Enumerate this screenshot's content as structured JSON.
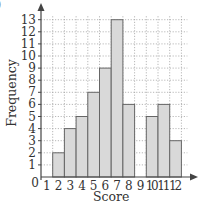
{
  "figure": {
    "clipped_label": ")"
  },
  "chart_data": {
    "type": "bar",
    "title": "",
    "xlabel": "Score",
    "ylabel": "Frequency",
    "categories": [
      "1",
      "2",
      "3",
      "4",
      "5",
      "6",
      "7",
      "8",
      "9",
      "10",
      "11",
      "12"
    ],
    "values": [
      0,
      2,
      4,
      5,
      7,
      9,
      13,
      6,
      0,
      5,
      6,
      3
    ],
    "xlim": [
      0,
      12
    ],
    "ylim": [
      0,
      13
    ],
    "yticks": [
      1,
      2,
      3,
      4,
      5,
      6,
      7,
      8,
      9,
      10,
      11,
      12,
      13
    ],
    "xticks": [
      1,
      2,
      3,
      4,
      5,
      6,
      7,
      8,
      9,
      10,
      11,
      12
    ],
    "origin_label": "0",
    "grid": true,
    "grid_style": "dotted",
    "legend": null,
    "bar_fill": "#d9d9d9",
    "bar_stroke": "#666666"
  }
}
